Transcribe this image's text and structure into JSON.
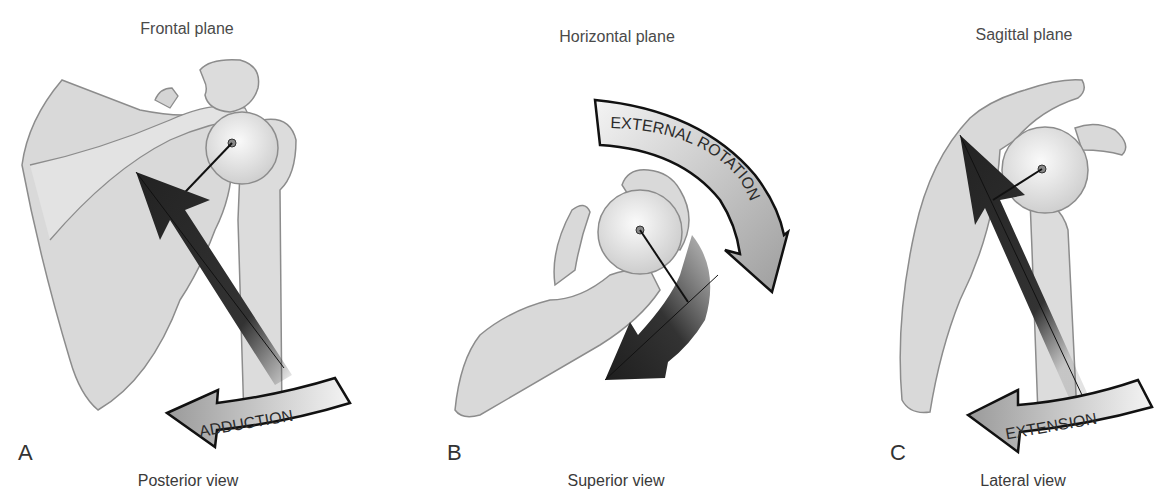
{
  "panels": [
    {
      "letter": "A",
      "plane": "Frontal plane",
      "view": "Posterior view",
      "motion_label": "ADDUCTION",
      "bones": [
        "scapula",
        "humerus",
        "acromion",
        "coracoid"
      ],
      "force_arrow": "dark muscle force vector pointing up-left toward scapula"
    },
    {
      "letter": "B",
      "plane": "Horizontal plane",
      "view": "Superior view",
      "motion_label": "EXTERNAL ROTATION",
      "bones": [
        "scapula",
        "humeral head",
        "acromion",
        "coracoid"
      ],
      "force_arrow": "dark curved force vector pointing down-left"
    },
    {
      "letter": "C",
      "plane": "Sagittal plane",
      "view": "Lateral view",
      "motion_label": "EXTENSION",
      "bones": [
        "scapula",
        "humerus",
        "acromion",
        "coracoid"
      ],
      "force_arrow": "dark muscle force vector pointing up toward scapula"
    }
  ],
  "colors": {
    "bone_fill": "#d9d9d9",
    "bone_stroke": "#8c8c8c",
    "force_arrow": "#2e2e2e",
    "motion_arrow_fill": "#b5b5b5",
    "text": "#3a3a3a"
  }
}
